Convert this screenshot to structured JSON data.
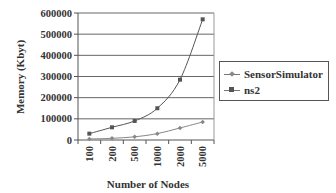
{
  "chart_data": {
    "type": "line",
    "title": "",
    "xlabel": "Number of Nodes",
    "ylabel": "Memory (Kbyt)",
    "categories": [
      "100",
      "200",
      "500",
      "1000",
      "2000",
      "5000"
    ],
    "series": [
      {
        "name": "SensorSimulator",
        "values": [
          5000,
          8000,
          15000,
          30000,
          57000,
          85000
        ],
        "color": "#888888",
        "marker": "diamond"
      },
      {
        "name": "ns2",
        "values": [
          30000,
          60000,
          90000,
          150000,
          285000,
          570000
        ],
        "color": "#555555",
        "marker": "square"
      }
    ],
    "ylim": [
      0,
      600000
    ],
    "yticks": [
      "0",
      "100000",
      "200000",
      "300000",
      "400000",
      "500000",
      "600000"
    ],
    "grid": true,
    "legend_position": "right"
  },
  "legend": {
    "items": [
      {
        "label": "SensorSimulator"
      },
      {
        "label": "ns2"
      }
    ]
  }
}
